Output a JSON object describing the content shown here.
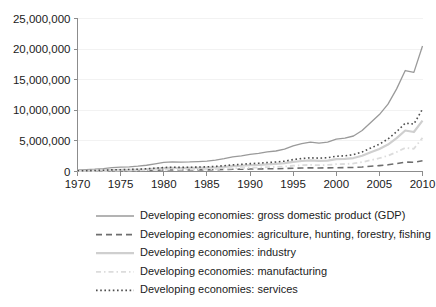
{
  "chart_data": {
    "type": "line",
    "title": "",
    "subtitle": "",
    "xlabel": "",
    "ylabel": "",
    "xlim": [
      1970,
      2010
    ],
    "ylim": [
      0,
      25000000
    ],
    "grid": true,
    "legend_position": "below",
    "x": [
      1970,
      1971,
      1972,
      1973,
      1974,
      1975,
      1976,
      1977,
      1978,
      1979,
      1980,
      1981,
      1982,
      1983,
      1984,
      1985,
      1986,
      1987,
      1988,
      1989,
      1990,
      1991,
      1992,
      1993,
      1994,
      1995,
      1996,
      1997,
      1998,
      1999,
      2000,
      2001,
      2002,
      2003,
      2004,
      2005,
      2006,
      2007,
      2008,
      2009,
      2010
    ],
    "xticks": [
      1970,
      1975,
      1980,
      1985,
      1990,
      1995,
      2000,
      2005,
      2010
    ],
    "xtick_labels": [
      "1970",
      "1975",
      "1980",
      "1985",
      "1990",
      "1995",
      "2000",
      "2005",
      "2010"
    ],
    "yticks": [
      0,
      5000000,
      10000000,
      15000000,
      20000000,
      25000000
    ],
    "ytick_labels": [
      "0",
      "5,000,000",
      "10,000,000",
      "15,000,000",
      "20,000,000",
      "25,000,000"
    ],
    "series": [
      {
        "name": "Developing economies: gross domestic product (GDP)",
        "style": "solid",
        "color": "#9a9a9a",
        "width": 1.3,
        "values": [
          280000,
          320000,
          380000,
          480000,
          640000,
          700000,
          760000,
          870000,
          1020000,
          1250000,
          1500000,
          1580000,
          1540000,
          1560000,
          1620000,
          1700000,
          1870000,
          2100000,
          2400000,
          2560000,
          2800000,
          2950000,
          3200000,
          3350000,
          3650000,
          4200000,
          4550000,
          4800000,
          4650000,
          4800000,
          5300000,
          5450000,
          5800000,
          6700000,
          8000000,
          9300000,
          11000000,
          13500000,
          16500000,
          16200000,
          20500000
        ]
      },
      {
        "name": "Developing economies: agriculture, hunting, forestry, fishing",
        "style": "dashed",
        "color": "#6e6e6e",
        "width": 1.6,
        "values": [
          70000,
          78000,
          88000,
          105000,
          125000,
          135000,
          142000,
          158000,
          180000,
          210000,
          240000,
          250000,
          248000,
          252000,
          262000,
          272000,
          295000,
          325000,
          360000,
          380000,
          400000,
          415000,
          440000,
          455000,
          485000,
          540000,
          575000,
          595000,
          580000,
          590000,
          620000,
          635000,
          665000,
          745000,
          860000,
          960000,
          1090000,
          1290000,
          1540000,
          1500000,
          1750000
        ]
      },
      {
        "name": "Developing economies: industry",
        "style": "solid",
        "color": "#cfcfcf",
        "width": 2.2,
        "values": [
          95000,
          110000,
          130000,
          170000,
          235000,
          255000,
          278000,
          315000,
          370000,
          460000,
          560000,
          590000,
          570000,
          578000,
          600000,
          628000,
          680000,
          765000,
          880000,
          940000,
          1030000,
          1080000,
          1180000,
          1240000,
          1360000,
          1580000,
          1715000,
          1810000,
          1730000,
          1790000,
          2010000,
          2060000,
          2200000,
          2580000,
          3130000,
          3680000,
          4400000,
          5450000,
          6700000,
          6450000,
          8300000
        ]
      },
      {
        "name": "Developing economies: manufacturing",
        "style": "dashdot",
        "color": "#dcdcdc",
        "width": 1.8,
        "values": [
          58000,
          67000,
          80000,
          102000,
          135000,
          148000,
          162000,
          186000,
          218000,
          266000,
          318000,
          336000,
          328000,
          335000,
          350000,
          368000,
          404000,
          455000,
          525000,
          562000,
          615000,
          648000,
          708000,
          745000,
          815000,
          945000,
          1025000,
          1080000,
          1035000,
          1072000,
          1195000,
          1225000,
          1310000,
          1530000,
          1850000,
          2170000,
          2590000,
          3180000,
          3860000,
          3720000,
          5500000
        ]
      },
      {
        "name": "Developing economies: services",
        "style": "dotted",
        "color": "#4d4d4d",
        "width": 1.6,
        "values": [
          118000,
          134000,
          158000,
          200000,
          265000,
          296000,
          325000,
          372000,
          440000,
          540000,
          650000,
          690000,
          678000,
          690000,
          720000,
          758000,
          838000,
          945000,
          1090000,
          1165000,
          1280000,
          1350000,
          1470000,
          1545000,
          1690000,
          1950000,
          2120000,
          2245000,
          2175000,
          2250000,
          2490000,
          2570000,
          2755000,
          3200000,
          3830000,
          4470000,
          5310000,
          6500000,
          7900000,
          7750000,
          10200000
        ]
      }
    ]
  },
  "legend": {
    "items": [
      {
        "label": "Developing economies: gross domestic product (GDP)"
      },
      {
        "label": "Developing economies: agriculture, hunting, forestry, fishing"
      },
      {
        "label": "Developing economies: industry"
      },
      {
        "label": "Developing economies: manufacturing"
      },
      {
        "label": "Developing economies: services"
      }
    ]
  }
}
